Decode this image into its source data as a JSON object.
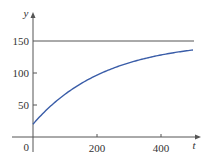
{
  "chart_data": {
    "type": "line",
    "title": "",
    "xlabel": "t",
    "ylabel": "y",
    "xlim": [
      0,
      500
    ],
    "ylim": [
      0,
      160
    ],
    "x_ticks": [
      200,
      400
    ],
    "y_ticks": [
      50,
      100,
      150
    ],
    "origin_label": "0",
    "grid": false,
    "series": [
      {
        "name": "y(t) = 150 - 130e^(-0.0045t)",
        "color": "#3a5da8",
        "x": [
          0,
          50,
          100,
          150,
          200,
          250,
          300,
          350,
          400,
          450,
          500
        ],
        "values": [
          20,
          47,
          67,
          84,
          97,
          108,
          116,
          122,
          128,
          132,
          136
        ]
      },
      {
        "name": "asymptote y = 150",
        "color": "#555555",
        "x": [
          0,
          500
        ],
        "values": [
          150,
          150
        ]
      }
    ]
  },
  "labels": {
    "x_axis": "t",
    "y_axis": "y",
    "origin": "0",
    "xt200": "200",
    "xt400": "400",
    "yt50": "50",
    "yt100": "100",
    "yt150": "150"
  }
}
